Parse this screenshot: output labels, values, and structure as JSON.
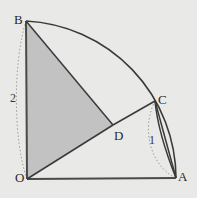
{
  "figure": {
    "background_color": "#e9e9e7",
    "shade_color": "#c2c2c2",
    "stroke_color": "#3a3a3a",
    "dotted_color": "#8f8f8f",
    "label_color": "#2a2a2a"
  },
  "points": {
    "O": {
      "label": "O",
      "x": 27,
      "y": 179,
      "label_x": 15,
      "label_y": 172
    },
    "A": {
      "label": "A",
      "x": 176,
      "y": 178,
      "label_x": 178,
      "label_y": 170
    },
    "B": {
      "label": "B",
      "x": 26,
      "y": 21,
      "label_x": 14,
      "label_y": 13
    },
    "C": {
      "label": "C",
      "x": 155,
      "y": 101,
      "label_x": 158,
      "label_y": 93
    },
    "D": {
      "label": "D",
      "x": 113,
      "y": 125,
      "label_x": 114,
      "label_y": 129
    }
  },
  "measurements": [
    {
      "name": "radius-OB",
      "label": "2",
      "x": 10,
      "y": 92
    },
    {
      "name": "radius-CA",
      "label": "1",
      "x": 149,
      "y": 134
    }
  ],
  "segments": [
    {
      "name": "segment-OA",
      "from": "O",
      "to": "A"
    },
    {
      "name": "segment-OB",
      "from": "O",
      "to": "B"
    },
    {
      "name": "segment-BD",
      "from": "B",
      "to": "D"
    },
    {
      "name": "segment-OD",
      "from": "O",
      "to": "D"
    },
    {
      "name": "segment-DC",
      "from": "D",
      "to": "C"
    },
    {
      "name": "segment-CA",
      "from": "C",
      "to": "A"
    }
  ],
  "arcs": [
    {
      "name": "major-arc-BA",
      "from": "B",
      "to": "A",
      "style": "solid"
    },
    {
      "name": "minor-arc-CA",
      "from": "C",
      "to": "A",
      "style": "dotted"
    },
    {
      "name": "dotted-arc-OB",
      "from": "O",
      "to": "B",
      "style": "dotted"
    }
  ],
  "shaded_region": {
    "name": "shaded-triangle-OBD",
    "vertices": [
      "O",
      "B",
      "D"
    ]
  }
}
